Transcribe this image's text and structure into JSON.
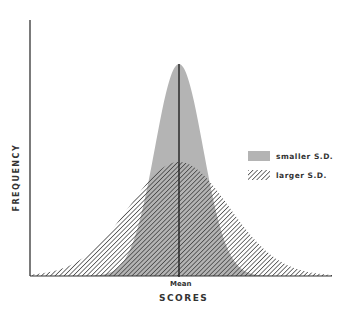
{
  "chart_data": {
    "type": "area",
    "title": "",
    "xlabel": "SCORES",
    "ylabel": "FREQUENCY",
    "x_marker_label": "Mean",
    "legend_position": "right",
    "grid": false,
    "series": [
      {
        "name": "smaller S.D.",
        "fill": "solid-gray",
        "color": "#b0b0b0",
        "mean": 0,
        "sd": 0.55,
        "relative_peak": 1.0
      },
      {
        "name": "larger S.D.",
        "fill": "diagonal-hatch",
        "color": "#333333",
        "mean": 0,
        "sd": 1.0,
        "relative_peak": 0.54
      }
    ]
  },
  "axes": {
    "y_label": "FREQUENCY",
    "x_label": "SCORES",
    "mean_label": "Mean"
  },
  "legend": {
    "items": [
      {
        "label": "smaller S.D."
      },
      {
        "label": "larger S.D."
      }
    ]
  },
  "colors": {
    "gray_fill": "#b4b4b4",
    "hatch": "#3a3a3a",
    "axis": "#333333"
  }
}
